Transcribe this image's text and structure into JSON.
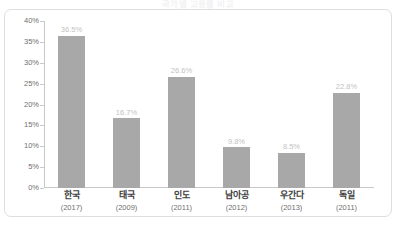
{
  "chart_data": {
    "type": "bar",
    "title": "국가별 고용률 비교",
    "xlabel": "",
    "ylabel": "",
    "ylim": [
      0,
      40
    ],
    "ytick_labels": [
      "40%",
      "35%",
      "30%",
      "25%",
      "20%",
      "15%",
      "10%",
      "5%",
      "0%"
    ],
    "ytick_values": [
      40,
      35,
      30,
      25,
      20,
      15,
      10,
      5,
      0
    ],
    "grid": false,
    "legend": "none",
    "categories": [
      "한국",
      "태국",
      "인도",
      "남아공",
      "우간다",
      "독일"
    ],
    "category_years": [
      "(2017)",
      "(2009)",
      "(2011)",
      "(2012)",
      "(2013)",
      "(2011)"
    ],
    "values": [
      36.5,
      16.7,
      26.6,
      9.8,
      8.5,
      22.8
    ],
    "value_labels": [
      "36.5%",
      "16.7%",
      "26.6%",
      "9.8%",
      "8.5%",
      "22.8%"
    ],
    "bars": [
      {
        "category": "한국",
        "year": "(2017)",
        "value": 36.5,
        "label": "36.5%"
      },
      {
        "category": "태국",
        "year": "(2009)",
        "value": 16.7,
        "label": "16.7%"
      },
      {
        "category": "인도",
        "year": "(2011)",
        "value": 26.6,
        "label": "26.6%"
      },
      {
        "category": "남아공",
        "year": "(2012)",
        "value": 9.8,
        "label": "9.8%"
      },
      {
        "category": "우간다",
        "year": "(2013)",
        "value": 8.5,
        "label": "8.5%"
      },
      {
        "category": "독일",
        "year": "(2011)",
        "value": 22.8,
        "label": "22.8%"
      }
    ],
    "colors": {
      "bar_fill": "#a8a8a8",
      "axis_line": "#c9c9c9",
      "tick_label": "#6f6f6f",
      "value_label": "#c2c2c2",
      "category_label": "#3d3d3d",
      "frame_border": "#dedede",
      "background": "#ffffff"
    }
  }
}
